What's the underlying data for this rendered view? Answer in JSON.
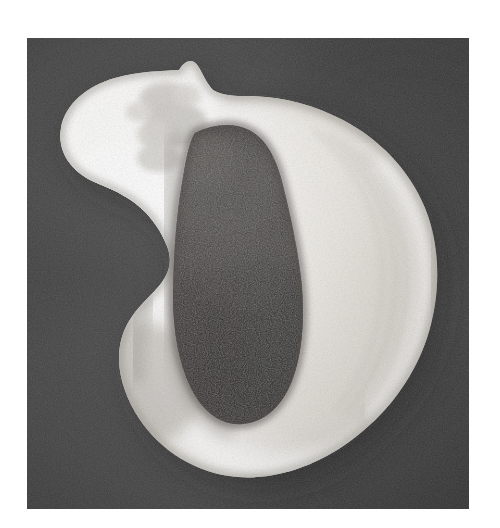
{
  "figure": {
    "kind": "photographic-plate",
    "view": "apertural",
    "medium": "black-and-white halftone print scan",
    "caption": "",
    "alt_text": "Black and white photograph of a globose gastropod shell seen from the apertural side, with a short pointed spire at upper left and a large dark aperture at center, on a dark gray background.",
    "canvas": {
      "width": 500,
      "height": 528,
      "page_background": "#ffffff"
    },
    "plate": {
      "x": 27,
      "y": 38,
      "width": 442,
      "height": 471,
      "background": "#3b3b3b",
      "background_note": "uniform dark gray with visible print grain"
    }
  },
  "palette": {
    "page_white": "#ffffff",
    "plate_dark_gray": "#3b3b3b",
    "plate_dark_gray_light": "#4a4a4a",
    "plate_dark_gray_deep": "#2e2e2e",
    "shell_highlight": "#fbfbf9",
    "shell_light": "#eceae5",
    "shell_midtone": "#d2cfc8",
    "shell_shadow": "#9c9890",
    "aperture_dark": "#2a2826",
    "aperture_darkest": "#1b1a18",
    "aperture_mid": "#4e4b47"
  },
  "shell": {
    "parts": [
      {
        "name": "body-whorl",
        "label": "body whorl",
        "tone": "light"
      },
      {
        "name": "spire-apex",
        "label": "spire / apex",
        "tone": "light-textured"
      },
      {
        "name": "aperture",
        "label": "aperture",
        "tone": "dark"
      },
      {
        "name": "outer-lip",
        "label": "outer lip",
        "tone": "highlight"
      },
      {
        "name": "columella",
        "label": "columella",
        "tone": "highlight"
      },
      {
        "name": "siphonal-notch",
        "label": "siphonal notch",
        "tone": "shadowed"
      },
      {
        "name": "growth-lines",
        "label": "growth lines",
        "tone": "midtone"
      }
    ],
    "geometry_note": "Body whorl occupies most of the plate; spire projects at upper left; aperture is a tall leaf-shaped dark region left-of-center."
  }
}
